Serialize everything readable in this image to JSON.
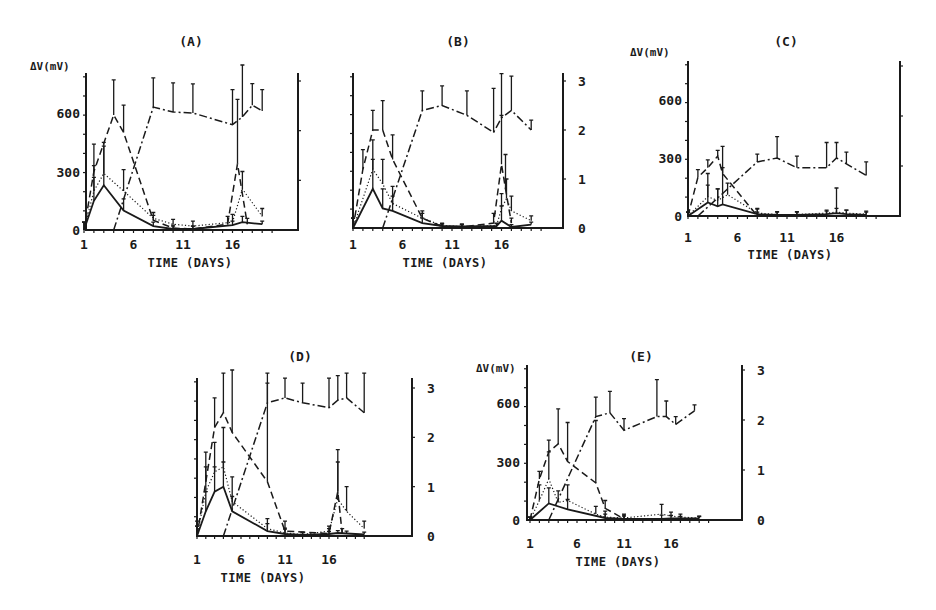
{
  "figure": {
    "panels": [
      {
        "id": "A",
        "title": "(A)",
        "left_ylabel": "ΔV(mV)",
        "left_ticks": [
          "0",
          "300",
          "600"
        ],
        "right_ticks": [],
        "xticks": [
          "1",
          "6",
          "11",
          "16"
        ],
        "xlabel": "TIME (DAYS)"
      },
      {
        "id": "B",
        "title": "(B)",
        "left_ylabel": "",
        "left_ticks": [],
        "right_ticks": [
          "0",
          "1",
          "2",
          "3"
        ],
        "xticks": [
          "1",
          "6",
          "11",
          "16"
        ],
        "xlabel": "TIME (DAYS)"
      },
      {
        "id": "C",
        "title": "(C)",
        "left_ylabel": "ΔV(mV)",
        "left_ticks": [
          "0",
          "300",
          "600"
        ],
        "right_ticks": [],
        "xticks": [
          "1",
          "6",
          "11",
          "16"
        ],
        "xlabel": "TIME (DAYS)"
      },
      {
        "id": "D",
        "title": "(D)",
        "left_ylabel": "",
        "left_ticks": [],
        "right_ticks": [
          "0",
          "1",
          "2",
          "3"
        ],
        "xticks": [
          "1",
          "6",
          "11",
          "16"
        ],
        "xlabel": "TIME (DAYS)"
      },
      {
        "id": "E",
        "title": "(E)",
        "left_ylabel": "ΔV(mV)",
        "left_ticks": [
          "0",
          "300",
          "600"
        ],
        "right_ticks": [
          "0",
          "1",
          "2",
          "3"
        ],
        "xticks": [
          "1",
          "6",
          "11",
          "16"
        ],
        "xlabel": "TIME (DAYS)"
      }
    ]
  },
  "chart_data": [
    {
      "panel": "A",
      "type": "line",
      "title": "(A)",
      "xlabel": "Time (days)",
      "ylabel": "ΔV (mV)",
      "xticks": [
        1,
        6,
        11,
        16
      ],
      "yticks_left": [
        0,
        300,
        600
      ],
      "ylim": [
        0,
        780
      ],
      "xlim": [
        1,
        24
      ],
      "series": [
        {
          "name": "solid",
          "style": "solid",
          "x": [
            1,
            2,
            3,
            5,
            8,
            10,
            12,
            16,
            17,
            19
          ],
          "values": [
            0,
            150,
            230,
            100,
            20,
            5,
            5,
            25,
            40,
            30
          ],
          "err": [
            40,
            120,
            200,
            60,
            20,
            15,
            15,
            20,
            30,
            15
          ]
        },
        {
          "name": "dotted",
          "style": "dotted",
          "x": [
            1,
            2,
            3,
            5,
            8,
            10,
            12,
            16,
            17,
            19
          ],
          "values": [
            0,
            200,
            290,
            200,
            60,
            30,
            20,
            40,
            210,
            70
          ],
          "err": [
            40,
            130,
            160,
            110,
            30,
            25,
            25,
            40,
            90,
            40
          ]
        },
        {
          "name": "dashed",
          "style": "dashed",
          "x": [
            1,
            2,
            4,
            5,
            8,
            10,
            12,
            15.5,
            16.5,
            17.5
          ],
          "values": [
            0,
            300,
            590,
            500,
            50,
            10,
            5,
            30,
            340,
            30
          ],
          "err": [
            40,
            140,
            180,
            140,
            25,
            15,
            15,
            40,
            330,
            30
          ]
        },
        {
          "name": "dash-dot",
          "style": "dashdot",
          "x": [
            4,
            8,
            10,
            12,
            16,
            17,
            18,
            19
          ],
          "values": [
            0,
            630,
            605,
            600,
            540,
            580,
            640,
            610
          ],
          "err": [
            0,
            150,
            150,
            150,
            180,
            300,
            110,
            110
          ]
        }
      ]
    },
    {
      "panel": "B",
      "type": "line",
      "title": "(B)",
      "xlabel": "Time (days)",
      "ylabel_right": "",
      "xticks": [
        1,
        6,
        11,
        16
      ],
      "yticks_right": [
        0,
        1,
        2,
        3
      ],
      "ylim": [
        0,
        3.2
      ],
      "xlim": [
        1,
        24
      ],
      "series": [
        {
          "name": "solid",
          "style": "solid",
          "x": [
            1,
            3,
            4,
            5,
            8,
            10,
            12,
            15.5,
            16,
            17,
            19
          ],
          "values": [
            0,
            0.8,
            0.4,
            0.35,
            0.1,
            0.04,
            0.03,
            0.04,
            0.15,
            0.02,
            0.07
          ],
          "err": [
            0.2,
            0.6,
            0.4,
            0.3,
            0.1,
            0.05,
            0.05,
            0.05,
            0.3,
            0.05,
            0.05
          ]
        },
        {
          "name": "dotted",
          "style": "dotted",
          "x": [
            1,
            3,
            4,
            5,
            8,
            10,
            12,
            15.5,
            16,
            16.5,
            17,
            19
          ],
          "values": [
            0,
            1.2,
            0.9,
            0.5,
            0.2,
            0.05,
            0.03,
            0.05,
            0.4,
            0.6,
            0.35,
            0.15
          ],
          "err": [
            0.2,
            0.6,
            0.5,
            0.35,
            0.15,
            0.05,
            0.05,
            0.05,
            0.3,
            0.4,
            0.3,
            0.1
          ]
        },
        {
          "name": "dashed",
          "style": "dashed",
          "x": [
            1,
            2,
            3,
            4,
            5,
            8,
            10,
            12,
            15.2,
            16,
            16.4,
            17
          ],
          "values": [
            0,
            1.2,
            2.0,
            2.0,
            1.4,
            0.2,
            0.03,
            0.02,
            0.1,
            1.3,
            0.8,
            0.1
          ],
          "err": [
            0.2,
            0.4,
            0.4,
            0.6,
            0.5,
            0.1,
            0.05,
            0.05,
            0.2,
            1.0,
            0.7,
            0.1
          ]
        },
        {
          "name": "dash-dot",
          "style": "dashdot",
          "x": [
            4,
            8,
            10,
            12.5,
            15.2,
            16,
            17,
            19
          ],
          "values": [
            0,
            2.4,
            2.5,
            2.3,
            1.95,
            2.25,
            2.4,
            2.0
          ],
          "err": [
            0,
            0.4,
            0.4,
            0.5,
            0.9,
            0.9,
            0.7,
            0.2
          ]
        }
      ]
    },
    {
      "panel": "C",
      "type": "line",
      "title": "(C)",
      "xlabel": "Time (days)",
      "ylabel": "ΔV (mV)",
      "xticks": [
        1,
        6,
        11,
        16
      ],
      "yticks_left": [
        0,
        300,
        600
      ],
      "ylim": [
        0,
        800
      ],
      "xlim": [
        1,
        24
      ],
      "series": [
        {
          "name": "solid",
          "style": "solid",
          "x": [
            1,
            3,
            4,
            4.5,
            8,
            10,
            12,
            15,
            16,
            17,
            19
          ],
          "values": [
            0,
            70,
            50,
            60,
            10,
            5,
            5,
            10,
            15,
            10,
            5
          ],
          "err": [
            20,
            150,
            90,
            300,
            30,
            15,
            15,
            15,
            130,
            20,
            15
          ]
        },
        {
          "name": "dotted",
          "style": "dotted",
          "x": [
            1,
            3,
            4,
            5,
            8,
            10,
            12,
            15,
            16,
            17,
            19
          ],
          "values": [
            0,
            100,
            80,
            110,
            15,
            8,
            8,
            15,
            20,
            15,
            10
          ],
          "err": [
            20,
            60,
            60,
            60,
            20,
            15,
            15,
            15,
            20,
            15,
            15
          ]
        },
        {
          "name": "dashed",
          "style": "dashed",
          "x": [
            1,
            2,
            3,
            4,
            4.5,
            8
          ],
          "values": [
            0,
            200,
            250,
            310,
            220,
            0
          ],
          "err": [
            20,
            40,
            40,
            30,
            30,
            20
          ]
        },
        {
          "name": "dash-dot",
          "style": "dashdot",
          "x": [
            2,
            8,
            10,
            12,
            15,
            16,
            17,
            19
          ],
          "values": [
            0,
            280,
            300,
            250,
            250,
            300,
            270,
            210
          ],
          "err": [
            0,
            40,
            110,
            60,
            130,
            80,
            60,
            70
          ]
        }
      ]
    },
    {
      "panel": "D",
      "type": "line",
      "title": "(D)",
      "xlabel": "Time (days)",
      "ylabel_right": "",
      "xticks": [
        1,
        6,
        11,
        16
      ],
      "yticks_right": [
        0,
        1,
        2,
        3
      ],
      "ylim": [
        0,
        3.2
      ],
      "xlim": [
        1,
        24
      ],
      "series": [
        {
          "name": "solid",
          "style": "solid",
          "x": [
            1,
            2,
            3,
            4,
            5,
            9,
            11,
            13,
            16,
            17,
            18,
            20
          ],
          "values": [
            0,
            0.5,
            0.9,
            1.0,
            0.5,
            0.1,
            0.04,
            0.02,
            0.04,
            0.06,
            0.05,
            0.03
          ],
          "err": [
            0.2,
            0.4,
            0.5,
            0.5,
            0.3,
            0.15,
            0.1,
            0.05,
            0.05,
            0.05,
            0.05,
            0.05
          ]
        },
        {
          "name": "dotted",
          "style": "dotted",
          "x": [
            1,
            2,
            3,
            4,
            5,
            9,
            11,
            13,
            16,
            17,
            18,
            20
          ],
          "values": [
            0,
            0.9,
            1.3,
            1.4,
            0.7,
            0.15,
            0.06,
            0.03,
            0.1,
            0.75,
            0.5,
            0.15
          ],
          "err": [
            0.2,
            0.5,
            0.6,
            0.8,
            0.5,
            0.2,
            0.1,
            0.05,
            0.1,
            1.0,
            0.5,
            0.15
          ]
        },
        {
          "name": "dashed",
          "style": "dashed",
          "x": [
            1,
            2,
            3,
            4,
            5,
            9,
            11,
            16,
            17,
            17.5
          ],
          "values": [
            0,
            1.1,
            2.2,
            2.5,
            2.1,
            1.1,
            0.1,
            0.05,
            0.9,
            0.05
          ],
          "err": [
            0.3,
            0.6,
            0.6,
            0.8,
            1.6,
            2.0,
            0.2,
            0.1,
            0.6,
            0.1
          ]
        },
        {
          "name": "dash-dot",
          "style": "dashdot",
          "x": [
            4,
            9,
            11,
            13,
            16,
            17,
            18,
            20
          ],
          "values": [
            0,
            2.7,
            2.8,
            2.7,
            2.6,
            2.75,
            2.8,
            2.5
          ],
          "err": [
            0,
            0.6,
            0.4,
            0.4,
            0.6,
            0.5,
            0.5,
            0.8
          ]
        }
      ]
    },
    {
      "panel": "E",
      "type": "line",
      "title": "(E)",
      "xlabel": "Time (days)",
      "ylabel": "ΔV (mV)",
      "xticks": [
        1,
        6,
        11,
        16
      ],
      "yticks_left": [
        0,
        300,
        600
      ],
      "yticks_right": [
        0,
        1,
        2,
        3
      ],
      "ylim": [
        0,
        800
      ],
      "xlim": [
        1,
        24
      ],
      "series": [
        {
          "name": "solid",
          "style": "solid",
          "x": [
            1,
            3,
            5,
            9,
            11,
            15,
            16,
            17,
            19
          ],
          "values": [
            0,
            85,
            55,
            10,
            5,
            5,
            8,
            8,
            8
          ],
          "err": [
            15,
            80,
            50,
            20,
            15,
            20,
            15,
            10,
            10
          ]
        },
        {
          "name": "dotted",
          "style": "dotted",
          "x": [
            1,
            2,
            3,
            4,
            5,
            8,
            9,
            11,
            15,
            16,
            17,
            19
          ],
          "values": [
            0,
            100,
            210,
            90,
            100,
            30,
            15,
            10,
            30,
            20,
            15,
            10
          ],
          "err": [
            15,
            80,
            140,
            60,
            80,
            40,
            30,
            20,
            50,
            20,
            15,
            10
          ]
        },
        {
          "name": "dashed",
          "style": "dashed",
          "x": [
            1,
            2,
            3,
            4,
            5,
            8,
            9,
            11
          ],
          "values": [
            0,
            210,
            350,
            390,
            300,
            190,
            60,
            5
          ],
          "err": [
            15,
            40,
            60,
            180,
            200,
            320,
            40,
            20
          ]
        },
        {
          "name": "dash-dot",
          "style": "dashdot",
          "x": [
            3,
            8,
            9.5,
            11,
            14.5,
            15.5,
            16.5,
            18.5
          ],
          "values": [
            0,
            530,
            550,
            460,
            530,
            530,
            490,
            560
          ],
          "err": [
            0,
            100,
            110,
            60,
            190,
            80,
            40,
            30
          ]
        }
      ]
    }
  ]
}
